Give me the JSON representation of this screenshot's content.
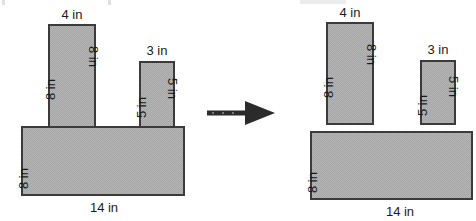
{
  "figure": {
    "type": "geometry-diagram",
    "caption_visible": false,
    "units": "in",
    "arrow": {
      "icon": "right-arrow-icon",
      "direction": "right",
      "meaning": "decompose-into-rectangles"
    },
    "left_figure": {
      "name": "composite-figure",
      "description": "Single composite polygon: 14 in by 8 in base with two rectangular tabs on top; dashed lines show internal decomposition joins.",
      "parts": [
        {
          "name": "tall-tab",
          "width_label": "4 in",
          "height_label_left": "8 in",
          "height_label_right": "8 in",
          "width_in": 4,
          "height_in": 8
        },
        {
          "name": "short-tab",
          "width_label": "3 in",
          "height_label_left": "5 in",
          "height_label_right": "5 in",
          "width_in": 3,
          "height_in": 5
        },
        {
          "name": "base",
          "width_label": "14 in",
          "height_label_left": "8 in",
          "width_in": 14,
          "height_in": 8
        }
      ]
    },
    "right_figure": {
      "name": "decomposed-figure",
      "description": "The same figure separated into three individual rectangles.",
      "parts": [
        {
          "name": "tall-rectangle",
          "width_label": "4 in",
          "height_label_left": "8 in",
          "height_label_right": "8 in",
          "width_in": 4,
          "height_in": 8
        },
        {
          "name": "short-rectangle",
          "width_label": "3 in",
          "height_label_left": "5 in",
          "height_label_right": "5 in",
          "width_in": 3,
          "height_in": 5
        },
        {
          "name": "base-rectangle",
          "width_label": "14 in",
          "height_label_left": "8 in",
          "width_in": 14,
          "height_in": 8
        }
      ]
    },
    "colors": {
      "fill": "#b6b6b6",
      "fill_dither": "#a5a5a5",
      "stroke": "#3b3b3b",
      "arrow": "#2b2b2b",
      "text": "#1a1a1a",
      "background": "#ffffff"
    }
  }
}
